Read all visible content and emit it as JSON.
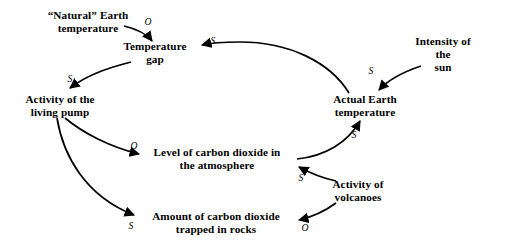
{
  "diagram": {
    "background_color": "#ffffff",
    "stroke_color": "#000000",
    "nodes": [
      {
        "id": "natural_temp",
        "label": "“Natural” Earth\ntemperature",
        "x": 88,
        "y": 22
      },
      {
        "id": "temp_gap",
        "label": "Temperature\ngap",
        "x": 155,
        "y": 53
      },
      {
        "id": "living_pump",
        "label": "Activity of the\nliving pump",
        "x": 60,
        "y": 106
      },
      {
        "id": "actual_temp",
        "label": "Actual Earth\ntemperature",
        "x": 365,
        "y": 106
      },
      {
        "id": "sun",
        "label": "Intensity of the\nsun",
        "x": 443,
        "y": 55
      },
      {
        "id": "co2_atm",
        "label": "Level of carbon dioxide in\nthe atmosphere",
        "x": 217,
        "y": 159
      },
      {
        "id": "volcanoes",
        "label": "Activity of\nvolcanoes",
        "x": 358,
        "y": 191
      },
      {
        "id": "co2_rocks",
        "label": "Amount of carbon dioxide\ntrapped in rocks",
        "x": 216,
        "y": 223
      }
    ],
    "links": [
      {
        "id": "l1",
        "from": "natural_temp",
        "to": "temp_gap",
        "polarity": "O",
        "label_x": 148,
        "label_y": 22
      },
      {
        "id": "l2",
        "from": "actual_temp",
        "to": "temp_gap",
        "polarity": "S",
        "label_x": 213,
        "label_y": 41
      },
      {
        "id": "l3",
        "from": "temp_gap",
        "to": "living_pump",
        "polarity": "S",
        "label_x": 70,
        "label_y": 79
      },
      {
        "id": "l4",
        "from": "sun",
        "to": "actual_temp",
        "polarity": "S",
        "label_x": 371,
        "label_y": 71
      },
      {
        "id": "l5",
        "from": "living_pump",
        "to": "co2_atm",
        "polarity": "O",
        "label_x": 134,
        "label_y": 146
      },
      {
        "id": "l6",
        "from": "living_pump",
        "to": "co2_rocks",
        "polarity": "S",
        "label_x": 131,
        "label_y": 226
      },
      {
        "id": "l7",
        "from": "co2_atm",
        "to": "actual_temp",
        "polarity": "S",
        "label_x": 354,
        "label_y": 135
      },
      {
        "id": "l8",
        "from": "volcanoes",
        "to": "co2_atm",
        "polarity": "S",
        "label_x": 301,
        "label_y": 178
      },
      {
        "id": "l9",
        "from": "volcanoes",
        "to": "co2_rocks",
        "polarity": "O",
        "label_x": 305,
        "label_y": 228
      }
    ]
  }
}
